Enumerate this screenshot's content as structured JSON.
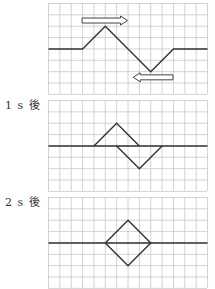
{
  "diagram": {
    "grid": {
      "cols": 14,
      "rows": 8,
      "cell_px": 11.36,
      "grid_color": "#c8c8c8",
      "line_color": "#333333"
    },
    "panels": [
      {
        "label": "",
        "top": 3,
        "description": "Two pulses moving toward each other",
        "baseline_row": 4,
        "polylines": [
          [
            [
              0,
              4
            ],
            [
              3,
              4
            ],
            [
              5,
              2
            ],
            [
              9,
              6
            ],
            [
              11,
              4
            ],
            [
              14,
              4
            ]
          ]
        ],
        "arrows": [
          {
            "direction": "right",
            "from": [
              3,
              1.5
            ],
            "to": [
              7,
              1.5
            ]
          },
          {
            "direction": "left",
            "from": [
              11,
              6.5
            ],
            "to": [
              7.5,
              6.5
            ]
          }
        ]
      },
      {
        "label": "1 s 後",
        "top": 100,
        "description": "Pulses overlapping after 1 s",
        "baseline_row": 4,
        "polylines": [
          [
            [
              0,
              4
            ],
            [
              14,
              4
            ]
          ],
          [
            [
              4,
              4
            ],
            [
              6,
              2
            ],
            [
              8,
              4
            ]
          ],
          [
            [
              6,
              4
            ],
            [
              8,
              6
            ],
            [
              10,
              4
            ]
          ]
        ],
        "arrows": []
      },
      {
        "label": "2 s 後",
        "top": 197,
        "description": "Pulses fully overlapping after 2 s forming a diamond",
        "baseline_row": 4,
        "polylines": [
          [
            [
              0,
              4
            ],
            [
              14,
              4
            ]
          ],
          [
            [
              5,
              4
            ],
            [
              7,
              2
            ],
            [
              9,
              4
            ],
            [
              7,
              6
            ],
            [
              5,
              4
            ]
          ]
        ],
        "arrows": []
      }
    ]
  }
}
